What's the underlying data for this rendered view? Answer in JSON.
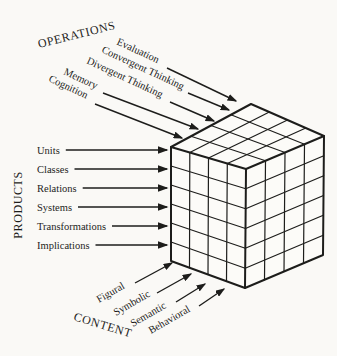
{
  "colors": {
    "background": "#faf9f6",
    "ink": "#1d1d1b"
  },
  "operations": {
    "title": "OPERATIONS",
    "items": [
      "Evaluation",
      "Convergent Thinking",
      "Divergent Thinking",
      "Memory",
      "Cognition"
    ]
  },
  "products": {
    "title": "PRODUCTS",
    "items": [
      "Units",
      "Classes",
      "Relations",
      "Systems",
      "Transformations",
      "Implications"
    ]
  },
  "content": {
    "title": "CONTENT",
    "items": [
      "Figural",
      "Symbolic",
      "Semantic",
      "Behavioral"
    ]
  },
  "cube": {
    "rows": 6,
    "front_columns": 4,
    "side_columns": 4
  }
}
